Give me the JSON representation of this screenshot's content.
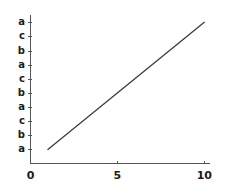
{
  "chart_data": {
    "type": "line",
    "title": "",
    "subtitle": "",
    "xlabel": "",
    "ylabel": "",
    "grid": false,
    "legend": null,
    "background_color": "#ffffff",
    "line_color": "#3c3c3c",
    "axis_color": "#555555",
    "text_color": "#1b1b1b",
    "xlim": [
      0,
      10.3
    ],
    "ylim": [
      0,
      10.6
    ],
    "xticks": [
      0,
      5,
      10
    ],
    "xticklabels": [
      "0",
      "5",
      "10"
    ],
    "yticks": [
      1,
      2,
      3,
      4,
      5,
      6,
      7,
      8,
      9,
      10
    ],
    "yticklabels": [
      "a",
      "b",
      "c",
      "a",
      "b",
      "c",
      "a",
      "b",
      "c",
      "a"
    ],
    "series": [
      {
        "name": "",
        "x": [
          1,
          10
        ],
        "y": [
          1,
          10.05
        ]
      }
    ]
  }
}
